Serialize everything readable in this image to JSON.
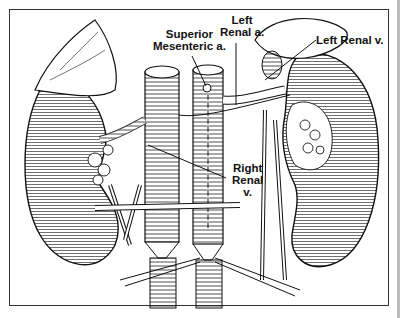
{
  "figure": {
    "type": "anatomical illustration",
    "labels": [
      {
        "id": "sma",
        "lines": [
          "Superior",
          "Mesenteric a."
        ]
      },
      {
        "id": "left_renal_a",
        "lines": [
          "Left",
          "Renal a."
        ]
      },
      {
        "id": "left_renal_v",
        "lines": [
          "Left Renal v."
        ]
      },
      {
        "id": "right_renal_v",
        "lines": [
          "Right",
          "Renal",
          "v."
        ]
      }
    ]
  }
}
